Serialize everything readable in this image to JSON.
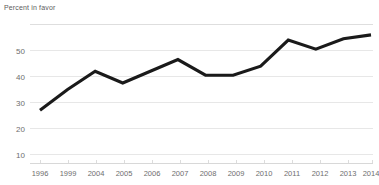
{
  "chart_data": {
    "type": "line",
    "title": "Percent in favor",
    "xlabel": "",
    "ylabel": "",
    "categories": [
      "1996",
      "1999",
      "2004",
      "2005",
      "2006",
      "2007",
      "2008",
      "2009",
      "2010",
      "2011",
      "2012",
      "2013",
      "2014"
    ],
    "values": [
      27,
      35,
      42,
      37.5,
      42,
      46.5,
      40.5,
      40.5,
      44,
      54,
      50.5,
      54.5,
      56
    ],
    "series": [
      {
        "name": "Percent in favor",
        "values": [
          27,
          35,
          42,
          37.5,
          42,
          46.5,
          40.5,
          40.5,
          44,
          54,
          50.5,
          54.5,
          56
        ]
      }
    ],
    "ylim": [
      0,
      60
    ],
    "y_ticks": [
      10,
      20,
      30,
      40,
      50
    ],
    "y_tick_labels": [
      "10",
      "20",
      "30",
      "40",
      "50"
    ],
    "grid": true,
    "grid_axis": "y",
    "legend": false,
    "legend_position": "none",
    "line_color": "#1a1a1a",
    "grid_color": "#e4e4e4",
    "background_color": "#ffffff",
    "text_color": "#6e6e6e"
  },
  "axes": {
    "y_tick_labels": [
      "50",
      "40",
      "30",
      "20",
      "10"
    ],
    "x_tick_labels": [
      "1996",
      "1999",
      "2004",
      "2005",
      "2006",
      "2007",
      "2008",
      "2009",
      "2010",
      "2011",
      "2012",
      "2013",
      "2014"
    ]
  }
}
